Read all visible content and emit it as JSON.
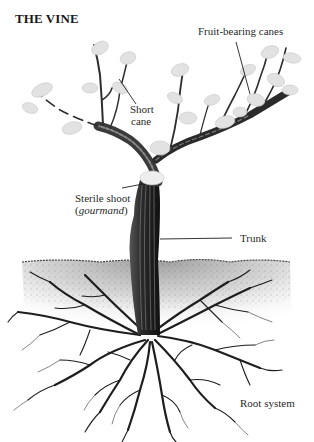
{
  "title": "THE VINE",
  "labels": {
    "fruit_bearing_canes": "Fruit-bearing canes",
    "short_cane_line1": "Short",
    "short_cane_line2": "cane",
    "sterile_shoot_line1": "Sterile shoot",
    "sterile_shoot_paren_open": "(",
    "sterile_shoot_italic": "gourmand",
    "sterile_shoot_paren_close": ")",
    "trunk": "Trunk",
    "root_system": "Root system"
  },
  "colors": {
    "ink": "#1e1e1e",
    "leaf": "#d9d9d9",
    "soil": "#9a9a9a",
    "background": "#ffffff"
  }
}
